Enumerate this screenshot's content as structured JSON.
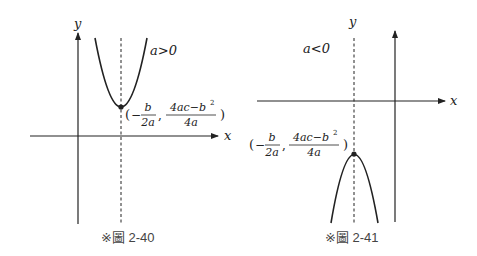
{
  "figures": [
    {
      "id": "fig-2-40",
      "caption": "※圖 2-40",
      "condition": "a>0",
      "axis_x_label": "x",
      "axis_y_label": "y",
      "vertex_label": {
        "open": "(",
        "minus": "−",
        "frac1_num": "b",
        "frac1_den": "2a",
        "comma": ",",
        "frac2_num": "4ac−b",
        "frac2_num_sup": "2",
        "frac2_den": "4a",
        "close": ")"
      },
      "parabola": "opens upward"
    },
    {
      "id": "fig-2-41",
      "caption": "※圖 2-41",
      "condition": "a<0",
      "axis_x_label": "x",
      "axis_y_label": "y",
      "vertex_label": {
        "open": "(",
        "minus": "−",
        "frac1_num": "b",
        "frac1_den": "2a",
        "comma": ",",
        "frac2_num": "4ac−b",
        "frac2_num_sup": "2",
        "frac2_den": "4a",
        "close": ")"
      },
      "parabola": "opens downward"
    }
  ],
  "colors": {
    "ink": "#222222",
    "caption": "#444444"
  }
}
